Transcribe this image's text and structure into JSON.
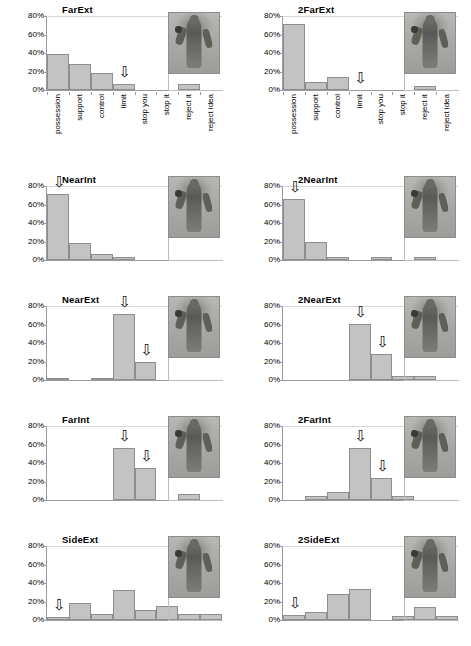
{
  "figure": {
    "categories": [
      "possession",
      "support",
      "control",
      "limit",
      "stop you",
      "stop it",
      "reject it",
      "reject idea"
    ],
    "y_ticks": [
      "0%",
      "20%",
      "40%",
      "60%",
      "80%"
    ],
    "arrow_glyph": "⇩"
  },
  "chart_data": [
    {
      "type": "bar",
      "title": "FarExt",
      "categories": [
        "possession",
        "support",
        "control",
        "limit",
        "stop you",
        "stop it",
        "reject it",
        "reject idea"
      ],
      "values": [
        39,
        28,
        18,
        7,
        0,
        0,
        6,
        0
      ],
      "arrows_at": [
        "limit"
      ],
      "xlabel": "",
      "ylabel": "",
      "ylim": [
        0,
        80
      ],
      "ytick_labels": [
        "0%",
        "20%",
        "40%",
        "60%",
        "80%"
      ],
      "grid": true,
      "thumbnail": "person-gesture-far-extended"
    },
    {
      "type": "bar",
      "title": "2FarExt",
      "categories": [
        "possession",
        "support",
        "control",
        "limit",
        "stop you",
        "stop it",
        "reject it",
        "reject idea"
      ],
      "values": [
        71,
        9,
        14,
        0,
        0,
        0,
        4,
        0
      ],
      "arrows_at": [
        "limit"
      ],
      "xlabel": "",
      "ylabel": "",
      "ylim": [
        0,
        80
      ],
      "ytick_labels": [
        "0%",
        "20%",
        "40%",
        "60%",
        "80%"
      ],
      "grid": true,
      "thumbnail": "person-gesture-2-far-extended"
    },
    {
      "type": "bar",
      "title": "NearInt",
      "categories": [
        "possession",
        "support",
        "control",
        "limit",
        "stop you",
        "stop it",
        "reject it",
        "reject idea"
      ],
      "values": [
        71,
        18,
        7,
        3,
        0,
        0,
        0,
        0
      ],
      "arrows_at": [
        "possession"
      ],
      "xlabel": "",
      "ylabel": "",
      "ylim": [
        0,
        80
      ],
      "ytick_labels": [
        "0%",
        "20%",
        "40%",
        "60%",
        "80%"
      ],
      "grid": true,
      "thumbnail": "person-gesture-near-internal"
    },
    {
      "type": "bar",
      "title": "2NearInt",
      "categories": [
        "possession",
        "support",
        "control",
        "limit",
        "stop you",
        "stop it",
        "reject it",
        "reject idea"
      ],
      "values": [
        66,
        19,
        3,
        0,
        3,
        0,
        3,
        0
      ],
      "arrows_at": [
        "possession"
      ],
      "xlabel": "",
      "ylabel": "",
      "ylim": [
        0,
        80
      ],
      "ytick_labels": [
        "0%",
        "20%",
        "40%",
        "60%",
        "80%"
      ],
      "grid": true,
      "thumbnail": "person-gesture-2-near-internal"
    },
    {
      "type": "bar",
      "title": "NearExt",
      "categories": [
        "possession",
        "support",
        "control",
        "limit",
        "stop you",
        "stop it",
        "reject it",
        "reject idea"
      ],
      "values": [
        2,
        0,
        2,
        71,
        20,
        0,
        0,
        0
      ],
      "arrows_at": [
        "limit",
        "stop you"
      ],
      "xlabel": "",
      "ylabel": "",
      "ylim": [
        0,
        80
      ],
      "ytick_labels": [
        "0%",
        "20%",
        "40%",
        "60%",
        "80%"
      ],
      "grid": true,
      "thumbnail": "person-gesture-near-extended"
    },
    {
      "type": "bar",
      "title": "2NearExt",
      "categories": [
        "possession",
        "support",
        "control",
        "limit",
        "stop you",
        "stop it",
        "reject it",
        "reject idea"
      ],
      "values": [
        0,
        0,
        0,
        61,
        28,
        4,
        4,
        0
      ],
      "arrows_at": [
        "limit",
        "stop you"
      ],
      "xlabel": "",
      "ylabel": "",
      "ylim": [
        0,
        80
      ],
      "ytick_labels": [
        "0%",
        "20%",
        "40%",
        "60%",
        "80%"
      ],
      "grid": true,
      "thumbnail": "person-gesture-2-near-extended"
    },
    {
      "type": "bar",
      "title": "FarInt",
      "categories": [
        "possession",
        "support",
        "control",
        "limit",
        "stop you",
        "stop it",
        "reject it",
        "reject idea"
      ],
      "values": [
        0,
        0,
        0,
        56,
        35,
        0,
        6,
        0
      ],
      "arrows_at": [
        "limit",
        "stop you"
      ],
      "xlabel": "",
      "ylabel": "",
      "ylim": [
        0,
        80
      ],
      "ytick_labels": [
        "0%",
        "20%",
        "40%",
        "60%",
        "80%"
      ],
      "grid": true,
      "thumbnail": "person-gesture-far-internal"
    },
    {
      "type": "bar",
      "title": "2FarInt",
      "categories": [
        "possession",
        "support",
        "control",
        "limit",
        "stop you",
        "stop it",
        "reject it",
        "reject idea"
      ],
      "values": [
        0,
        4,
        9,
        56,
        24,
        4,
        0,
        0
      ],
      "arrows_at": [
        "limit",
        "stop you"
      ],
      "xlabel": "",
      "ylabel": "",
      "ylim": [
        0,
        80
      ],
      "ytick_labels": [
        "0%",
        "20%",
        "40%",
        "60%",
        "80%"
      ],
      "grid": true,
      "thumbnail": "person-gesture-2-far-internal"
    },
    {
      "type": "bar",
      "title": "SideExt",
      "categories": [
        "possession",
        "support",
        "control",
        "limit",
        "stop you",
        "stop it",
        "reject it",
        "reject idea"
      ],
      "values": [
        3,
        18,
        7,
        32,
        11,
        15,
        7,
        7
      ],
      "arrows_at": [
        "possession"
      ],
      "xlabel": "",
      "ylabel": "",
      "ylim": [
        0,
        80
      ],
      "ytick_labels": [
        "0%",
        "20%",
        "40%",
        "60%",
        "80%"
      ],
      "grid": true,
      "thumbnail": "person-gesture-side-extended"
    },
    {
      "type": "bar",
      "title": "2SideExt",
      "categories": [
        "possession",
        "support",
        "control",
        "limit",
        "stop you",
        "stop it",
        "reject it",
        "reject idea"
      ],
      "values": [
        5,
        9,
        28,
        33,
        0,
        4,
        14,
        4
      ],
      "arrows_at": [
        "possession"
      ],
      "xlabel": "",
      "ylabel": "",
      "ylim": [
        0,
        80
      ],
      "ytick_labels": [
        "0%",
        "20%",
        "40%",
        "60%",
        "80%"
      ],
      "grid": true,
      "thumbnail": "person-gesture-2-side-extended"
    }
  ]
}
